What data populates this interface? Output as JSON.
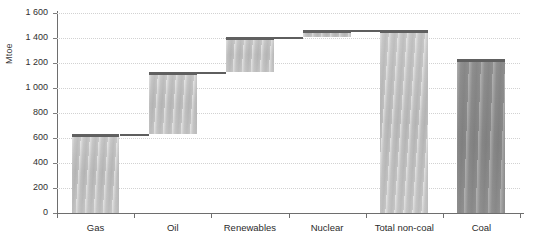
{
  "chart_data": {
    "type": "bar",
    "subtype": "waterfall",
    "title": "",
    "xlabel": "",
    "ylabel": "Mtoe",
    "ylim": [
      0,
      1600
    ],
    "y_ticks": [
      0,
      200,
      400,
      600,
      800,
      1000,
      1200,
      1400,
      1600
    ],
    "y_tick_labels": [
      "0",
      "200",
      "400",
      "600",
      "800",
      "1 000",
      "1 200",
      "1 400",
      "1 600"
    ],
    "grid": true,
    "grid_style": "dotted",
    "legend": "none",
    "categories": [
      "Gas",
      "Oil",
      "Renewables",
      "Nuclear",
      "Total non-coal",
      "Coal"
    ],
    "values": [
      630,
      500,
      275,
      60,
      1465,
      1230
    ],
    "cumulative_start": [
      0,
      630,
      1130,
      1405,
      0,
      0
    ],
    "cumulative_end": [
      630,
      1130,
      1405,
      1465,
      1465,
      1230
    ],
    "bar_styles": [
      "light",
      "light",
      "light",
      "light",
      "light",
      "dark"
    ],
    "colors": {
      "bar_light": "#c2c2c2",
      "bar_dark": "#8a8a8a",
      "bar_cap": "#606060",
      "connector": "#5e5e5e",
      "gridline": "#d2d2d2",
      "axis": "#6e6e6e",
      "text": "#2b2b2b"
    }
  },
  "axis": {
    "y_title": "Mtoe",
    "ticks": [
      {
        "label": "1 600",
        "value": 1600
      },
      {
        "label": "1 400",
        "value": 1400
      },
      {
        "label": "1 200",
        "value": 1200
      },
      {
        "label": "1 000",
        "value": 1000
      },
      {
        "label": "800",
        "value": 800
      },
      {
        "label": "600",
        "value": 600
      },
      {
        "label": "400",
        "value": 400
      },
      {
        "label": "200",
        "value": 200
      },
      {
        "label": "0",
        "value": 0
      }
    ],
    "categories": [
      {
        "label": "Gas"
      },
      {
        "label": "Oil"
      },
      {
        "label": "Renewables"
      },
      {
        "label": "Nuclear"
      },
      {
        "label": "Total non-coal"
      },
      {
        "label": "Coal"
      }
    ]
  }
}
